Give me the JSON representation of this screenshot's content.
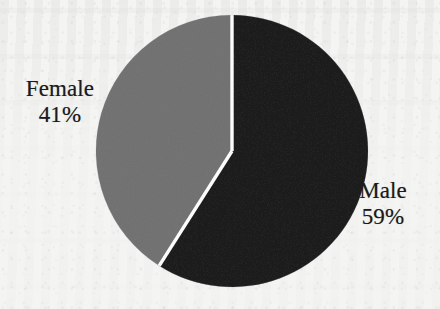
{
  "chart_data": {
    "type": "pie",
    "title": "",
    "subtitle": "",
    "xlabel": "",
    "ylabel": "",
    "legend_position": "none",
    "grid": false,
    "units": "percent",
    "categories": [
      "Male",
      "Female"
    ],
    "values": [
      59,
      41
    ],
    "slices": [
      {
        "label": "Male",
        "value": 59,
        "value_text": "59%",
        "color": "#595959",
        "start_angle_deg": 0,
        "end_angle_deg": 212.4
      },
      {
        "label": "Female",
        "value": 41,
        "value_text": "41%",
        "color": "#ababab",
        "start_angle_deg": 212.4,
        "end_angle_deg": 360
      }
    ],
    "labels": [
      {
        "name": "Female",
        "percent": "41%"
      },
      {
        "name": "Male",
        "percent": "59%"
      }
    ],
    "geometry": {
      "center_x": 232,
      "center_y": 151,
      "radius": 136,
      "separator_color": "#fbfbfa",
      "separator_width": 3
    },
    "colors": {
      "background": "#f4f4f3",
      "male_slice": "#595959",
      "female_slice": "#ababab",
      "label_text": "#1b1b1b",
      "separator": "#fbfbfa"
    }
  }
}
